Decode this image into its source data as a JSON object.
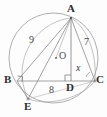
{
  "figure": {
    "type": "geometry-diagram",
    "background_color": "#fdfdfd",
    "stroke_color": "#8a8a8a",
    "label_color": "#3b3b3b"
  },
  "points": [
    {
      "id": "A",
      "label": "A",
      "x": 71,
      "y": 18,
      "label_x": 69,
      "label_y": 4,
      "dot": true
    },
    {
      "id": "B",
      "label": "B",
      "x": 17,
      "y": 81,
      "label_x": 6,
      "label_y": 76,
      "dot": false
    },
    {
      "id": "C",
      "label": "C",
      "x": 95,
      "y": 81,
      "label_x": 96,
      "label_y": 76,
      "dot": true
    },
    {
      "id": "D",
      "label": "D",
      "x": 71,
      "y": 81,
      "label_x": 67,
      "label_y": 84,
      "dot": false
    },
    {
      "id": "E",
      "label": "E",
      "x": 28,
      "y": 99,
      "label_x": 25,
      "label_y": 102,
      "dot": true
    },
    {
      "id": "O",
      "label": "O",
      "x": 56,
      "y": 58,
      "label_x": 59,
      "label_y": 52,
      "dot": true
    }
  ],
  "segment_labels": [
    {
      "id": "AB",
      "text": "9",
      "x": 31,
      "y": 36
    },
    {
      "id": "AC",
      "text": "7",
      "x": 85,
      "y": 38
    },
    {
      "id": "BE",
      "text": "8",
      "x": 50,
      "y": 86
    }
  ],
  "angle_labels": [
    {
      "id": "angle-at-C",
      "text": "x",
      "x": 76,
      "y": 64
    }
  ],
  "marks": [
    {
      "id": "right-angle-B",
      "type": "right-angle",
      "at": "B"
    },
    {
      "id": "right-angle-D",
      "type": "right-angle",
      "at": "D"
    }
  ]
}
